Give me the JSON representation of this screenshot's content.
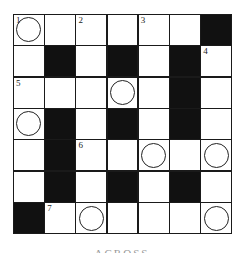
{
  "puzzle": {
    "rows": 7,
    "cols": 7,
    "cells": [
      [
        {
          "t": "w",
          "n": "1",
          "c": true
        },
        {
          "t": "w"
        },
        {
          "t": "w",
          "n": "2"
        },
        {
          "t": "w"
        },
        {
          "t": "w",
          "n": "3"
        },
        {
          "t": "w"
        },
        {
          "t": "b"
        }
      ],
      [
        {
          "t": "w"
        },
        {
          "t": "b"
        },
        {
          "t": "w"
        },
        {
          "t": "b"
        },
        {
          "t": "w"
        },
        {
          "t": "b"
        },
        {
          "t": "w",
          "n": "4"
        }
      ],
      [
        {
          "t": "w",
          "n": "5"
        },
        {
          "t": "w"
        },
        {
          "t": "w"
        },
        {
          "t": "w",
          "c": true
        },
        {
          "t": "w"
        },
        {
          "t": "b"
        },
        {
          "t": "w"
        }
      ],
      [
        {
          "t": "w",
          "c": true
        },
        {
          "t": "b"
        },
        {
          "t": "w"
        },
        {
          "t": "b"
        },
        {
          "t": "w"
        },
        {
          "t": "b"
        },
        {
          "t": "w"
        }
      ],
      [
        {
          "t": "w"
        },
        {
          "t": "b"
        },
        {
          "t": "w",
          "n": "6"
        },
        {
          "t": "w"
        },
        {
          "t": "w",
          "c": true
        },
        {
          "t": "w"
        },
        {
          "t": "w",
          "c": true
        }
      ],
      [
        {
          "t": "w"
        },
        {
          "t": "b"
        },
        {
          "t": "w"
        },
        {
          "t": "b"
        },
        {
          "t": "w"
        },
        {
          "t": "b"
        },
        {
          "t": "w"
        }
      ],
      [
        {
          "t": "b"
        },
        {
          "t": "w",
          "n": "7"
        },
        {
          "t": "w",
          "c": true
        },
        {
          "t": "w"
        },
        {
          "t": "w"
        },
        {
          "t": "w"
        },
        {
          "t": "w",
          "c": true
        }
      ]
    ]
  },
  "caption": "ACROSS"
}
